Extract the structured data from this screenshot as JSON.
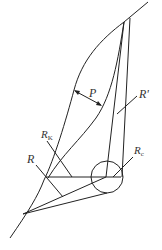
{
  "diagram": {
    "labels": {
      "P": "P",
      "R_prime": "R'",
      "R_K_main": "R",
      "R_K_sub": "K",
      "R": "R",
      "R_c_main": "R",
      "R_c_sub": "c"
    },
    "colors": {
      "stroke": "#222222",
      "background": "#ffffff"
    }
  }
}
